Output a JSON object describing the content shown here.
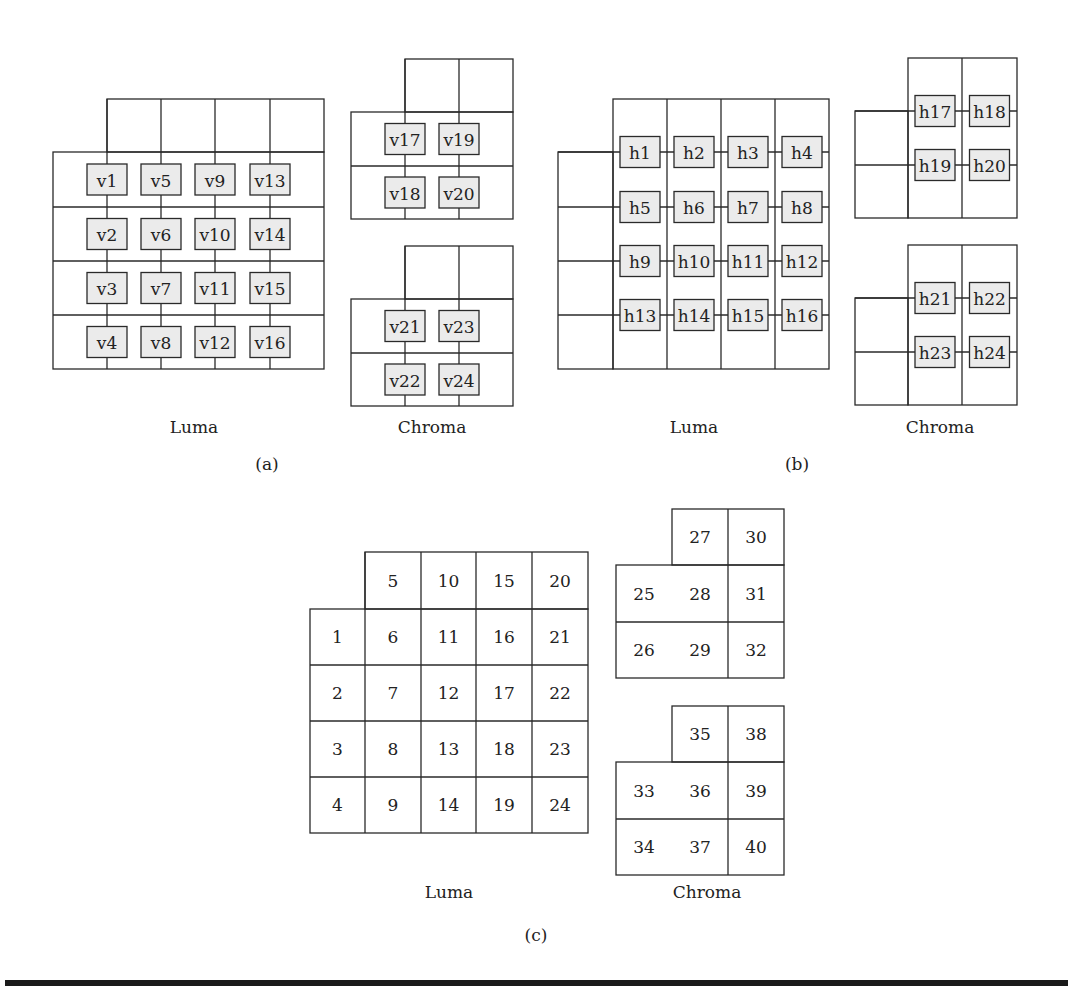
{
  "figure": {
    "panels": [
      {
        "id": "a",
        "caption": "(a)",
        "luma_label": "Luma",
        "chroma_label": "Chroma",
        "luma_edges": [
          "v1",
          "v2",
          "v3",
          "v4",
          "v5",
          "v6",
          "v7",
          "v8",
          "v9",
          "v10",
          "v11",
          "v12",
          "v13",
          "v14",
          "v15",
          "v16"
        ],
        "chroma_top_edges": [
          "v17",
          "v18",
          "v19",
          "v20"
        ],
        "chroma_bottom_edges": [
          "v21",
          "v22",
          "v23",
          "v24"
        ]
      },
      {
        "id": "b",
        "caption": "(b)",
        "luma_label": "Luma",
        "chroma_label": "Chroma",
        "luma_edges": [
          "h1",
          "h2",
          "h3",
          "h4",
          "h5",
          "h6",
          "h7",
          "h8",
          "h9",
          "h10",
          "h11",
          "h12",
          "h13",
          "h14",
          "h15",
          "h16"
        ],
        "chroma_top_edges": [
          "h17",
          "h18",
          "h19",
          "h20"
        ],
        "chroma_bottom_edges": [
          "h21",
          "h22",
          "h23",
          "h24"
        ]
      },
      {
        "id": "c",
        "caption": "(c)",
        "luma_label": "Luma",
        "chroma_label": "Chroma",
        "luma_top_row": [
          "5",
          "10",
          "15",
          "20"
        ],
        "luma_rows": [
          [
            "1",
            "6",
            "11",
            "16",
            "21"
          ],
          [
            "2",
            "7",
            "12",
            "17",
            "22"
          ],
          [
            "3",
            "8",
            "13",
            "18",
            "23"
          ],
          [
            "4",
            "9",
            "14",
            "19",
            "24"
          ]
        ],
        "chroma_top": {
          "top_row": [
            "27",
            "30"
          ],
          "rows": [
            [
              "25",
              "28",
              "31"
            ],
            [
              "26",
              "29",
              "32"
            ]
          ]
        },
        "chroma_bottom": {
          "top_row": [
            "35",
            "38"
          ],
          "rows": [
            [
              "33",
              "36",
              "39"
            ],
            [
              "34",
              "37",
              "40"
            ]
          ]
        }
      }
    ],
    "colors": {
      "line": "#2a2a2a",
      "edge_box_fill": "#ebebeb",
      "rule": "#1a1a1a"
    }
  }
}
